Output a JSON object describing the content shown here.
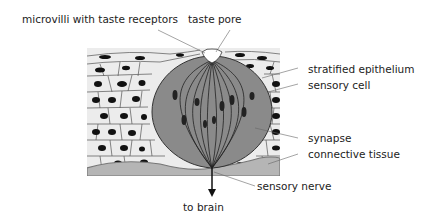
{
  "diagram": {
    "labels": {
      "microvilli": "microvilli with taste receptors",
      "taste_pore": "taste pore",
      "stratified_epithelium": "stratified epithelium",
      "sensory_cell": "sensory cell",
      "synapse": "synapse",
      "connective_tissue": "connective tissue",
      "sensory_nerve": "sensory nerve",
      "to_brain": "to brain"
    },
    "colors": {
      "epithelium": "#ececec",
      "taste_bud": "#8a8a8a",
      "connective_tissue": "#b5b5b5",
      "nucleus": "#111111",
      "outline": "#333333"
    }
  }
}
